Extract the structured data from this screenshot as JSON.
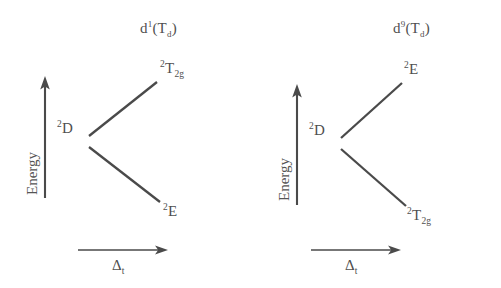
{
  "figure": {
    "background_color": "#ffffff",
    "line_color": "#4a4a4a"
  },
  "panels": [
    {
      "id": "left",
      "title": {
        "config": "d",
        "superscript": "1",
        "symmetry_open": "(T",
        "symmetry_sub": "d",
        "symmetry_close": ")"
      },
      "y_axis": {
        "label": "Energy",
        "arrow": "up-arrow"
      },
      "x_axis": {
        "label_symbol": "Δ",
        "label_sub": "t",
        "arrow": "right-arrow"
      },
      "free_ion_term": {
        "multiplicity": "2",
        "symbol": "D"
      },
      "upper_term": {
        "multiplicity": "2",
        "symbol": "T",
        "sub": "2g"
      },
      "lower_term": {
        "multiplicity": "2",
        "symbol": "E",
        "sub": ""
      }
    },
    {
      "id": "right",
      "title": {
        "config": "d",
        "superscript": "9",
        "symmetry_open": "(T",
        "symmetry_sub": "d",
        "symmetry_close": ")"
      },
      "y_axis": {
        "label": "Energy",
        "arrow": "up-arrow"
      },
      "x_axis": {
        "label_symbol": "Δ",
        "label_sub": "t",
        "arrow": "right-arrow"
      },
      "free_ion_term": {
        "multiplicity": "2",
        "symbol": "D"
      },
      "upper_term": {
        "multiplicity": "2",
        "symbol": "E",
        "sub": ""
      },
      "lower_term": {
        "multiplicity": "2",
        "symbol": "T",
        "sub": "2g"
      }
    }
  ]
}
